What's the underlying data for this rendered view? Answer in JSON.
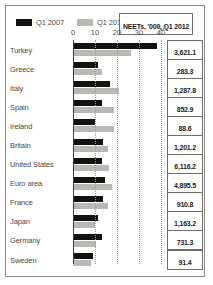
{
  "chart_data": {
    "type": "bar",
    "title": "NEETs, '000, Q1 2012",
    "orientation": "horizontal",
    "xlabel": "",
    "ylabel": "",
    "xlim": [
      0,
      44
    ],
    "xticks": [
      0,
      10,
      20,
      30,
      40
    ],
    "grid": true,
    "legend_position": "top-left",
    "legend": [
      "Q1 2007",
      "Q1 2012"
    ],
    "categories": [
      "Turkey",
      "Greece",
      "Italy",
      "Spain",
      "Ireland",
      "Britain",
      "United States",
      "Euro area",
      "France",
      "Japan",
      "Germany",
      "Sweden"
    ],
    "series": [
      {
        "name": "Q1 2007",
        "color": "#121212",
        "values": [
          38.0,
          11.5,
          17.0,
          13.0,
          10.0,
          13.5,
          13.0,
          14.5,
          13.5,
          11.5,
          13.0,
          9.0
        ]
      },
      {
        "name": "Q1 2012",
        "color": "#b9b9b4",
        "values": [
          26.5,
          13.0,
          21.0,
          18.5,
          18.5,
          16.0,
          16.5,
          17.5,
          16.0,
          10.0,
          10.5,
          8.0
        ]
      }
    ],
    "value_labels": [
      "3,621.1",
      "283.3",
      "1,287.8",
      "852.9",
      "88.6",
      "1,201.2",
      "6,116.2",
      "4,895.5",
      "910.8",
      "1,163.2",
      "731.3",
      "91.4"
    ]
  },
  "colors": {
    "series_1": "#121212",
    "series_2": "#b9b9b4",
    "border": "#8a8a86",
    "text": "#4a4a46",
    "background": "#ffffff"
  }
}
